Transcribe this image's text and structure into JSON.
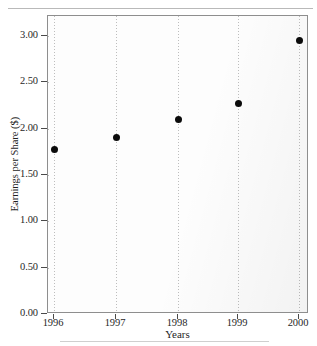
{
  "chart_data": {
    "type": "scatter",
    "title": "",
    "xlabel": "Years",
    "ylabel": "Earnings per Share ($)",
    "x": [
      1996,
      1997,
      1998,
      1999,
      2000
    ],
    "categories": [
      "1996",
      "1997",
      "1998",
      "1999",
      "2000"
    ],
    "values": [
      1.77,
      1.9,
      2.1,
      2.27,
      2.95
    ],
    "series": [
      {
        "name": "Earnings per Share",
        "values": [
          1.77,
          1.9,
          2.1,
          2.27,
          2.95
        ]
      }
    ],
    "ylim": [
      0.0,
      3.15
    ],
    "xlim": [
      1995.9,
      2000.1
    ],
    "ytick_labels": [
      "0.00",
      "0.50",
      "1.00",
      "1.50",
      "2.00",
      "2.50",
      "3.00"
    ],
    "ytick_values": [
      0.0,
      0.5,
      1.0,
      1.5,
      2.0,
      2.5,
      3.0
    ],
    "xtick_labels": [
      "1996",
      "1997",
      "1998",
      "1999",
      "2000"
    ],
    "xtick_values": [
      1996,
      1997,
      1998,
      1999,
      2000
    ],
    "grid": true,
    "grid_style": "dotted",
    "legend": false,
    "legend_position": "none",
    "marker": "filled-circle",
    "marker_color": "#0b0b0b",
    "frame_color": "#8e8e8e",
    "grid_color": "#bdbdbd",
    "plot_background": "#fdfdfd"
  }
}
